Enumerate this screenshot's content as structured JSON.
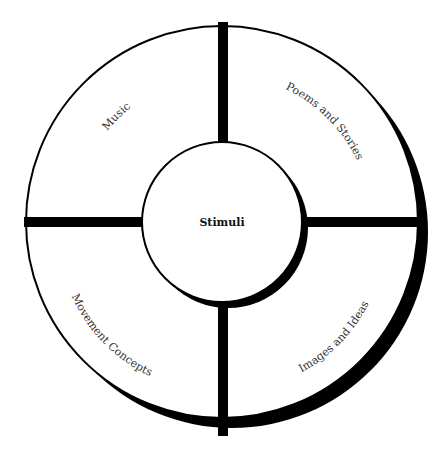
{
  "diagram": {
    "center": {
      "label": "Stimuli"
    },
    "segments": [
      {
        "id": "music",
        "label": "Music",
        "position": "top-left"
      },
      {
        "id": "poems",
        "label": "Poems and Stories",
        "position": "top-right"
      },
      {
        "id": "movement",
        "label": "Movement Concepts",
        "position": "bottom-left"
      },
      {
        "id": "images",
        "label": "Images and Ideas",
        "position": "bottom-right"
      }
    ],
    "colors": {
      "stroke": "#000000",
      "fill": "#ffffff",
      "shadow": "#000000",
      "text": "#333333"
    }
  }
}
